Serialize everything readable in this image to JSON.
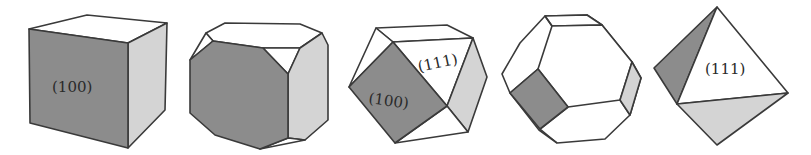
{
  "figure": {
    "colors": {
      "face_100": "#8c8c8c",
      "face_side": "#d4d4d4",
      "face_111": "#ffffff",
      "edge": "#3a3a3a"
    },
    "shapes": [
      {
        "name": "cube",
        "labels": [
          "(100)"
        ]
      },
      {
        "name": "truncated-cube",
        "labels": []
      },
      {
        "name": "cuboctahedron",
        "labels": [
          "(111)",
          "(100)"
        ]
      },
      {
        "name": "truncated-octahedron",
        "labels": []
      },
      {
        "name": "octahedron",
        "labels": [
          "(111)"
        ]
      }
    ]
  }
}
